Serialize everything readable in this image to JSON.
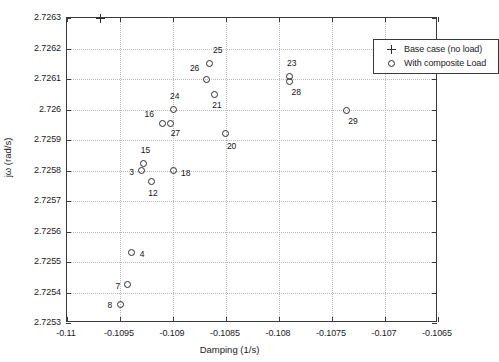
{
  "chart_data": {
    "type": "scatter",
    "title": "",
    "xlabel": "Damping (1/s)",
    "ylabel": "jω (rad/s)",
    "xlim": [
      -0.11,
      -0.1065
    ],
    "ylim": [
      2.7253,
      2.7263
    ],
    "xticks": [
      -0.11,
      -0.1095,
      -0.109,
      -0.1085,
      -0.108,
      -0.1075,
      -0.107,
      -0.1065
    ],
    "xtick_labels": [
      "-0.11",
      "-0.1095",
      "-0.109",
      "-0.1085",
      "-0.108",
      "-0.1075",
      "-0.107",
      "-0.1065"
    ],
    "yticks": [
      2.7253,
      2.7254,
      2.7255,
      2.7256,
      2.7257,
      2.7258,
      2.7259,
      2.726,
      2.7261,
      2.7262,
      2.7263
    ],
    "ytick_labels": [
      "2.7253",
      "2.7254",
      "2.7255",
      "2.7256",
      "2.7257",
      "2.7258",
      "2.7259",
      "2.726",
      "2.7261",
      "2.7262",
      "2.7263"
    ],
    "grid": true,
    "legend_position": "upper right",
    "legend": [
      {
        "marker": "plus",
        "label": "Base case (no load)"
      },
      {
        "marker": "circle",
        "label": "With composite Load"
      }
    ],
    "series": [
      {
        "name": "Base case (no load)",
        "marker": "plus",
        "color": "#2e2e2e",
        "points": [
          {
            "label": "",
            "x": -0.10968,
            "y": 2.7263,
            "label_dx": 0,
            "label_dy": 0
          }
        ]
      },
      {
        "name": "With composite Load",
        "marker": "circle",
        "color": "#2e2e2e",
        "points": [
          {
            "label": "25",
            "x": -0.10866,
            "y": 2.72615,
            "label_dx": 4,
            "label_dy": -14
          },
          {
            "label": "26",
            "x": -0.10868,
            "y": 2.726098,
            "label_dx": -17,
            "label_dy": -12
          },
          {
            "label": "21",
            "x": -0.10861,
            "y": 2.72605,
            "label_dx": -2,
            "label_dy": 11
          },
          {
            "label": "23",
            "x": -0.107905,
            "y": 2.726108,
            "label_dx": -2,
            "label_dy": -14
          },
          {
            "label": "28",
            "x": -0.1079,
            "y": 2.726092,
            "label_dx": 2,
            "label_dy": 11
          },
          {
            "label": "24",
            "x": -0.108999,
            "y": 2.726,
            "label_dx": -3,
            "label_dy": -14
          },
          {
            "label": "29",
            "x": -0.107365,
            "y": 2.725998,
            "label_dx": 2,
            "label_dy": 11
          },
          {
            "label": "16",
            "x": -0.109098,
            "y": 2.725955,
            "label_dx": -18,
            "label_dy": -9
          },
          {
            "label": "27",
            "x": -0.109022,
            "y": 2.725955,
            "label_dx": 0,
            "label_dy": 10
          },
          {
            "label": "20",
            "x": -0.108501,
            "y": 2.72592,
            "label_dx": 1,
            "label_dy": 12
          },
          {
            "label": "15",
            "x": -0.109275,
            "y": 2.725823,
            "label_dx": -3,
            "label_dy": -13
          },
          {
            "label": "3",
            "x": -0.1093,
            "y": 2.7258,
            "label_dx": -12,
            "label_dy": 1
          },
          {
            "label": "18",
            "x": -0.108999,
            "y": 2.7258,
            "label_dx": 8,
            "label_dy": 2
          },
          {
            "label": "12",
            "x": -0.109205,
            "y": 2.725763,
            "label_dx": -3,
            "label_dy": 11
          },
          {
            "label": "4",
            "x": -0.10939,
            "y": 2.725532,
            "label_dx": 8,
            "label_dy": 2
          },
          {
            "label": "7",
            "x": -0.10943,
            "y": 2.725425,
            "label_dx": -12,
            "label_dy": 1
          },
          {
            "label": "8",
            "x": -0.109495,
            "y": 2.725362,
            "label_dx": -13,
            "label_dy": 1
          }
        ]
      }
    ]
  }
}
